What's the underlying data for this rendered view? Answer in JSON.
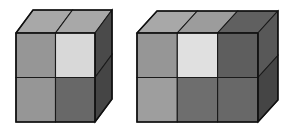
{
  "canvas": {
    "width": 294,
    "height": 132,
    "background": "#ffffff",
    "description": "Two isometric stacked-cube block figures drawn side by side on a white background"
  },
  "palette": {
    "outline": "#111111",
    "edge": "#1a1a1a",
    "light": "#d8d8d8",
    "lighter": "#e0e0e0",
    "top_light": "#a8a8a8",
    "top_mid": "#9c9c9c",
    "top_dark": "#606060",
    "medium": "#969696",
    "medium_light": "#9e9e9e",
    "dark": "#686868",
    "darker": "#6e6e6e",
    "side_dark": "#4a4a4a",
    "side_darker": "#454545",
    "side_mid": "#585858"
  },
  "figures": [
    {
      "id": "figure-left",
      "name": "left-block",
      "columns": 2,
      "rows": 2,
      "depth": 1,
      "cube_count": 4,
      "front_origin": {
        "x": 16,
        "y": 33
      },
      "cell_width": 39.5,
      "cell_height": 44.5,
      "depth_offset": {
        "dx": 17,
        "dy": -23
      },
      "front_cells": [
        {
          "row": 0,
          "col": 0,
          "name": "left-front-r0c0",
          "color": "#969696",
          "shade": "medium"
        },
        {
          "row": 0,
          "col": 1,
          "name": "left-front-r0c1",
          "color": "#d8d8d8",
          "shade": "light"
        },
        {
          "row": 1,
          "col": 0,
          "name": "left-front-r1c0",
          "color": "#969696",
          "shade": "medium"
        },
        {
          "row": 1,
          "col": 1,
          "name": "left-front-r1c1",
          "color": "#686868",
          "shade": "dark"
        }
      ],
      "top_cells": [
        {
          "col": 0,
          "name": "left-top-c0",
          "color": "#a8a8a8",
          "shade": "top-light"
        },
        {
          "col": 1,
          "name": "left-top-c1",
          "color": "#a8a8a8",
          "shade": "top-light"
        }
      ],
      "side_cells": [
        {
          "row": 0,
          "name": "left-side-r0",
          "color": "#4a4a4a",
          "shade": "side-dark"
        },
        {
          "row": 1,
          "name": "left-side-r1",
          "color": "#454545",
          "shade": "side-darker"
        }
      ]
    },
    {
      "id": "figure-right",
      "name": "right-block",
      "columns": 3,
      "rows": 2,
      "depth": 1,
      "cube_count": 6,
      "front_origin": {
        "x": 137,
        "y": 33
      },
      "cell_width": 40.3,
      "cell_height": 44.5,
      "depth_offset": {
        "dx": 20,
        "dy": -22
      },
      "front_cells": [
        {
          "row": 0,
          "col": 0,
          "name": "right-front-r0c0",
          "color": "#969696",
          "shade": "medium"
        },
        {
          "row": 0,
          "col": 1,
          "name": "right-front-r0c1",
          "color": "#e0e0e0",
          "shade": "lighter"
        },
        {
          "row": 0,
          "col": 2,
          "name": "right-front-r0c2",
          "color": "#5e5e5e",
          "shade": "dark"
        },
        {
          "row": 1,
          "col": 0,
          "name": "right-front-r1c0",
          "color": "#9e9e9e",
          "shade": "medium-light"
        },
        {
          "row": 1,
          "col": 1,
          "name": "right-front-r1c1",
          "color": "#6e6e6e",
          "shade": "darker"
        },
        {
          "row": 1,
          "col": 2,
          "name": "right-front-r1c2",
          "color": "#686868",
          "shade": "dark"
        }
      ],
      "top_cells": [
        {
          "col": 0,
          "name": "right-top-c0",
          "color": "#a8a8a8",
          "shade": "top-light"
        },
        {
          "col": 1,
          "name": "right-top-c1",
          "color": "#9c9c9c",
          "shade": "top-mid"
        },
        {
          "col": 2,
          "name": "right-top-c2",
          "color": "#606060",
          "shade": "top-dark"
        }
      ],
      "side_cells": [
        {
          "row": 0,
          "name": "right-side-r0",
          "color": "#585858",
          "shade": "side-mid"
        },
        {
          "row": 1,
          "name": "right-side-r1",
          "color": "#454545",
          "shade": "side-darker"
        }
      ]
    }
  ]
}
